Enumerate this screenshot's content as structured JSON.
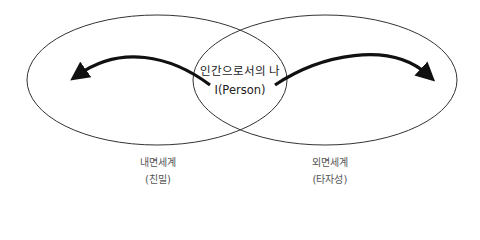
{
  "center_label": {
    "line1": "인간으로서의 나",
    "line2": "I(Person)"
  },
  "left_circle": {
    "title": "내면세계",
    "subtitle": "(친밀)"
  },
  "right_circle": {
    "title": "외면세계",
    "subtitle": "(타자성)"
  },
  "colors": {
    "stroke": "#222222",
    "text": "#555555"
  }
}
